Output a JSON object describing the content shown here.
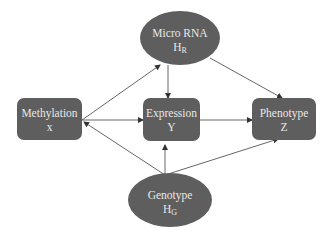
{
  "diagram": {
    "nodes": {
      "microrna": {
        "label": "Micro RNA",
        "symbol": "H",
        "subscript": "R",
        "shape": "ellipse"
      },
      "methylation": {
        "label": "Methylation",
        "symbol": "x",
        "shape": "rounded-rect"
      },
      "expression": {
        "label": "Expression",
        "symbol": "Y",
        "shape": "rounded-rect"
      },
      "phenotype": {
        "label": "Phenotype",
        "symbol": "Z",
        "shape": "rounded-rect"
      },
      "genotype": {
        "label": "Genotype",
        "symbol": "H",
        "subscript": "G",
        "shape": "ellipse"
      }
    },
    "edges": [
      {
        "from": "microrna",
        "to": "expression"
      },
      {
        "from": "microrna",
        "to": "phenotype"
      },
      {
        "from": "methylation",
        "to": "microrna"
      },
      {
        "from": "methylation",
        "to": "expression"
      },
      {
        "from": "expression",
        "to": "phenotype"
      },
      {
        "from": "genotype",
        "to": "expression"
      },
      {
        "from": "genotype",
        "to": "methylation"
      },
      {
        "from": "genotype",
        "to": "phenotype"
      }
    ],
    "colors": {
      "node_fill": "#5e5e5e",
      "node_text": "#e8e8e8",
      "edge": "#444444"
    }
  }
}
